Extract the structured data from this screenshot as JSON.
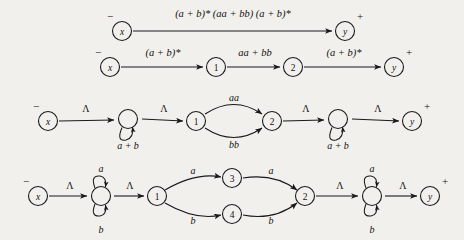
{
  "figure": {
    "background_color": "#f2f0ec",
    "ink_color": "#1a1a1a",
    "signs": {
      "start": "−",
      "accept": "+"
    },
    "symbols": {
      "lambda": "Λ",
      "a": "a",
      "b": "b",
      "aa": "aa",
      "bb": "bb",
      "a_plus_b": "a + b"
    },
    "rows": [
      {
        "id": "row-1",
        "kind": "single-edge-regex",
        "nodes": [
          {
            "id": "x",
            "label": "x",
            "mark": "−",
            "cx": 122,
            "cy": 31
          },
          {
            "id": "y",
            "label": "y",
            "mark": "+",
            "cx": 345,
            "cy": 31
          }
        ],
        "edges": [
          {
            "from": "x",
            "to": "y",
            "label": "(a + b)* (aa + bb) (a + b)*",
            "label_x": 233,
            "label_y": 17
          }
        ]
      },
      {
        "id": "row-2",
        "kind": "three-edge-regex",
        "nodes": [
          {
            "id": "x",
            "label": "x",
            "mark": "−",
            "cx": 110,
            "cy": 67
          },
          {
            "id": "1",
            "label": "1",
            "mark": "",
            "cx": 216,
            "cy": 67
          },
          {
            "id": "2",
            "label": "2",
            "mark": "",
            "cx": 293,
            "cy": 67
          },
          {
            "id": "y",
            "label": "y",
            "mark": "+",
            "cx": 394,
            "cy": 67
          }
        ],
        "edges": [
          {
            "from": "x",
            "to": "1",
            "label": "(a + b)*",
            "label_x": 163,
            "label_y": 56
          },
          {
            "from": "1",
            "to": "2",
            "label": "aa + bb",
            "label_x": 255,
            "label_y": 56
          },
          {
            "from": "2",
            "to": "y",
            "label": "(a + b)*",
            "label_x": 344,
            "label_y": 56
          }
        ]
      },
      {
        "id": "row-3",
        "kind": "expanded-loops",
        "nodes": [
          {
            "id": "x",
            "label": "x",
            "mark": "−",
            "cx": 48,
            "cy": 121
          },
          {
            "id": "L1",
            "label": "",
            "mark": "",
            "cx": 128,
            "cy": 119,
            "loop_label": "a + b",
            "loop_label_x": 128,
            "loop_label_y": 146
          },
          {
            "id": "1",
            "label": "1",
            "mark": "",
            "cx": 196,
            "cy": 121
          },
          {
            "id": "2",
            "label": "2",
            "mark": "",
            "cx": 272,
            "cy": 121
          },
          {
            "id": "L2",
            "label": "",
            "mark": "",
            "cx": 338,
            "cy": 119,
            "loop_label": "a + b",
            "loop_label_x": 338,
            "loop_label_y": 146
          },
          {
            "id": "y",
            "label": "y",
            "mark": "+",
            "cx": 412,
            "cy": 121
          }
        ],
        "edges": [
          {
            "from": "x",
            "to": "L1",
            "label": "Λ",
            "label_x": 86,
            "label_y": 112
          },
          {
            "from": "L1",
            "to": "1",
            "label": "Λ",
            "label_x": 164,
            "label_y": 112
          },
          {
            "from": "1",
            "to": "2",
            "label": "aa",
            "label_x": 234,
            "label_y": 101,
            "curve": "up"
          },
          {
            "from": "1",
            "to": "2",
            "label": "bb",
            "label_x": 234,
            "label_y": 146,
            "curve": "down"
          },
          {
            "from": "2",
            "to": "L2",
            "label": "Λ",
            "label_x": 306,
            "label_y": 112
          },
          {
            "from": "L2",
            "to": "y",
            "label": "Λ",
            "label_x": 378,
            "label_y": 112
          }
        ]
      },
      {
        "id": "row-4",
        "kind": "fully-expanded",
        "nodes": [
          {
            "id": "x",
            "label": "x",
            "mark": "−",
            "cx": 38,
            "cy": 196
          },
          {
            "id": "L1",
            "label": "",
            "mark": "",
            "cx": 101,
            "cy": 196,
            "loop_top_label": "a",
            "loop_bottom_label": "b",
            "loop_top_label_x": 101,
            "loop_top_label_y": 170,
            "loop_bottom_label_x": 101,
            "loop_bottom_label_y": 231
          },
          {
            "id": "1",
            "label": "1",
            "mark": "",
            "cx": 157,
            "cy": 196
          },
          {
            "id": "3",
            "label": "3",
            "mark": "",
            "cx": 232,
            "cy": 178
          },
          {
            "id": "4",
            "label": "4",
            "mark": "",
            "cx": 232,
            "cy": 214
          },
          {
            "id": "2",
            "label": "2",
            "mark": "",
            "cx": 305,
            "cy": 196
          },
          {
            "id": "L2",
            "label": "",
            "mark": "",
            "cx": 372,
            "cy": 196,
            "loop_top_label": "a",
            "loop_bottom_label": "b",
            "loop_top_label_x": 372,
            "loop_top_label_y": 170,
            "loop_bottom_label_x": 372,
            "loop_bottom_label_y": 231
          },
          {
            "id": "y",
            "label": "y",
            "mark": "+",
            "cx": 430,
            "cy": 196
          }
        ],
        "edges": [
          {
            "from": "x",
            "to": "L1",
            "label": "Λ",
            "label_x": 70,
            "label_y": 189
          },
          {
            "from": "L1",
            "to": "1",
            "label": "Λ",
            "label_x": 130,
            "label_y": 189
          },
          {
            "from": "1",
            "to": "3",
            "label": "a",
            "label_x": 193,
            "label_y": 172,
            "curve": "up"
          },
          {
            "from": "1",
            "to": "4",
            "label": "b",
            "label_x": 193,
            "label_y": 221,
            "curve": "down"
          },
          {
            "from": "3",
            "to": "2",
            "label": "a",
            "label_x": 270,
            "label_y": 172,
            "curve": "up"
          },
          {
            "from": "4",
            "to": "2",
            "label": "b",
            "label_x": 270,
            "label_y": 221,
            "curve": "down"
          },
          {
            "from": "2",
            "to": "L2",
            "label": "Λ",
            "label_x": 340,
            "label_y": 189
          },
          {
            "from": "L2",
            "to": "y",
            "label": "Λ",
            "label_x": 403,
            "label_y": 189
          }
        ]
      }
    ]
  }
}
